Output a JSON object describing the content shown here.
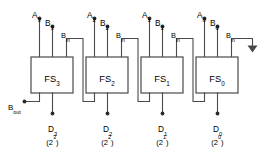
{
  "diagram": {
    "type": "logic-circuit-schematic",
    "colors": {
      "background": "#ffffff",
      "wire": "#4a4a4a",
      "box_fill": "#ffffff",
      "box_stroke": "#4a4a4a",
      "text": "#1c1c1c",
      "terminal_dot": "#2b2b2b"
    },
    "cells": [
      {
        "id": "fs3",
        "name": "FS",
        "index": "3",
        "input_a": {
          "name": "A",
          "index": "3"
        },
        "input_b": {
          "name": "B",
          "index": "3"
        },
        "borrow_in": {
          "name": "B",
          "index": "in"
        },
        "output_d": {
          "name": "D",
          "index": "3"
        },
        "weight": "(2",
        "weight_exp": "3",
        "weight_close": ")"
      },
      {
        "id": "fs2",
        "name": "FS",
        "index": "2",
        "input_a": {
          "name": "A",
          "index": "2"
        },
        "input_b": {
          "name": "B",
          "index": "2"
        },
        "borrow_in": {
          "name": "B",
          "index": "in"
        },
        "output_d": {
          "name": "D",
          "index": "2"
        },
        "weight": "(2",
        "weight_exp": "2",
        "weight_close": ")"
      },
      {
        "id": "fs1",
        "name": "FS",
        "index": "1",
        "input_a": {
          "name": "A",
          "index": "1"
        },
        "input_b": {
          "name": "B",
          "index": "1"
        },
        "borrow_in": {
          "name": "B",
          "index": "in"
        },
        "output_d": {
          "name": "D",
          "index": "1"
        },
        "weight": "(2",
        "weight_exp": "1",
        "weight_close": ")"
      },
      {
        "id": "fs0",
        "name": "FS",
        "index": "0",
        "input_a": {
          "name": "A",
          "index": "0"
        },
        "input_b": {
          "name": "B",
          "index": "0"
        },
        "borrow_in": {
          "name": "B",
          "index": "in"
        },
        "output_d": {
          "name": "D",
          "index": "0"
        },
        "weight": "(2",
        "weight_exp": "0",
        "weight_close": ")"
      }
    ],
    "borrow_out": {
      "name": "B",
      "index": "out"
    }
  }
}
